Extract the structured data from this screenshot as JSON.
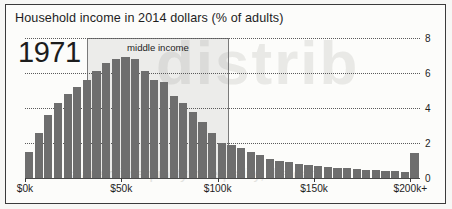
{
  "figure": {
    "title": "Household income in 2014 dollars (% of adults)",
    "year_label": "1971",
    "band_label": "middle income",
    "watermark": "distrib",
    "watermark_caption": "share of inequality or equality, the data"
  },
  "chart_data": {
    "type": "bar",
    "title": "Household income in 2014 dollars (% of adults)",
    "xlabel": "Household income in 2014 dollars",
    "ylabel": "% of adults",
    "xlim": [
      0,
      205
    ],
    "ylim": [
      0,
      8
    ],
    "grid": true,
    "legend_position": "none",
    "xtick_values": [
      0,
      50,
      100,
      150,
      200
    ],
    "xtick_labels": [
      "$0k",
      "$50k",
      "$100k",
      "$150k",
      "$200k+"
    ],
    "ytick_values": [
      0,
      2,
      4,
      6,
      8
    ],
    "ytick_labels": [
      "0",
      "2",
      "4",
      "6",
      "8"
    ],
    "bin_width_k": 5,
    "annotations": [
      {
        "text": "middle income",
        "x_start_k": 32,
        "x_end_k": 106
      },
      {
        "text": "1971",
        "x_k": 3,
        "y": 7.4
      }
    ],
    "bar_color": "#6e6e6e",
    "band_color": "#78787820",
    "categories": [
      "$0-5k",
      "$5-10k",
      "$10-15k",
      "$15-20k",
      "$20-25k",
      "$25-30k",
      "$30-35k",
      "$35-40k",
      "$40-45k",
      "$45-50k",
      "$50-55k",
      "$55-60k",
      "$60-65k",
      "$65-70k",
      "$70-75k",
      "$75-80k",
      "$80-85k",
      "$85-90k",
      "$90-95k",
      "$95-100k",
      "$100-105k",
      "$105-110k",
      "$110-115k",
      "$115-120k",
      "$120-125k",
      "$125-130k",
      "$130-135k",
      "$135-140k",
      "$140-145k",
      "$145-150k",
      "$150-155k",
      "$155-160k",
      "$160-165k",
      "$165-170k",
      "$170-175k",
      "$175-180k",
      "$180-185k",
      "$185-190k",
      "$190-195k",
      "$195-200k",
      "$200k+"
    ],
    "values": [
      1.5,
      2.6,
      3.6,
      4.3,
      4.8,
      5.2,
      5.6,
      6.1,
      6.6,
      6.8,
      6.9,
      6.8,
      6.1,
      5.6,
      5.5,
      4.7,
      4.3,
      3.8,
      3.2,
      2.6,
      2.0,
      1.9,
      1.7,
      1.5,
      1.3,
      1.1,
      1.0,
      0.9,
      0.8,
      0.75,
      0.7,
      0.62,
      0.58,
      0.55,
      0.5,
      0.47,
      0.44,
      0.4,
      0.38,
      0.35,
      1.45
    ]
  }
}
